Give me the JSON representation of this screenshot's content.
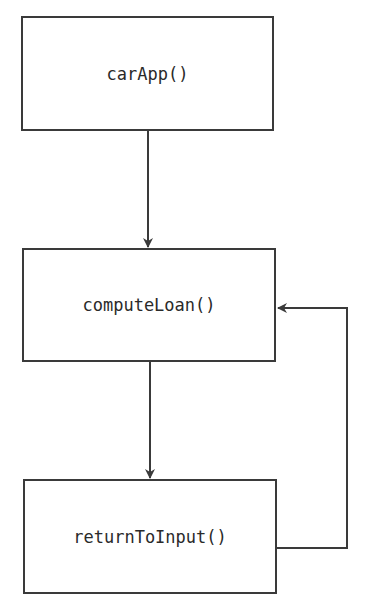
{
  "diagram": {
    "type": "flowchart",
    "nodes": [
      {
        "id": "carApp",
        "label": "carApp()"
      },
      {
        "id": "computeLoan",
        "label": "computeLoan()"
      },
      {
        "id": "returnToInput",
        "label": "returnToInput()"
      }
    ],
    "edges": [
      {
        "from": "carApp",
        "to": "computeLoan"
      },
      {
        "from": "computeLoan",
        "to": "returnToInput"
      },
      {
        "from": "returnToInput",
        "to": "computeLoan"
      }
    ],
    "colors": {
      "stroke": "#3a3a3a",
      "text": "#2a2a2a",
      "background": "#ffffff"
    }
  }
}
